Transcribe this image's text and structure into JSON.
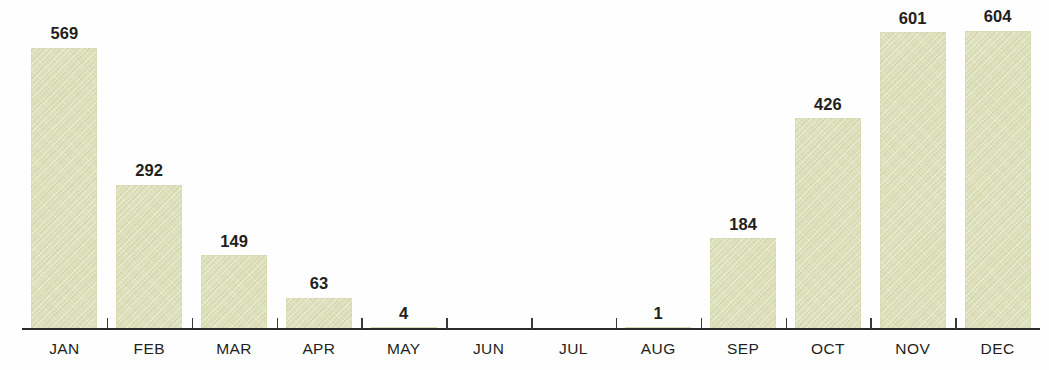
{
  "chart_data": {
    "type": "bar",
    "title": "",
    "subtitle": "",
    "xlabel": "",
    "ylabel": "",
    "categories": [
      "JAN",
      "FEB",
      "MAR",
      "APR",
      "MAY",
      "JUN",
      "JUL",
      "AUG",
      "SEP",
      "OCT",
      "NOV",
      "DEC"
    ],
    "values": [
      569,
      292,
      149,
      63,
      4,
      0,
      0,
      1,
      184,
      426,
      601,
      604
    ],
    "value_labels": [
      "569",
      "292",
      "149",
      "63",
      "4",
      "",
      "",
      "1",
      "184",
      "426",
      "601",
      "604"
    ],
    "ylim": [
      0,
      650
    ],
    "grid": false,
    "legend": null,
    "legend_position": "none",
    "axis": {
      "x_axis_visible": true,
      "y_axis_visible": false,
      "tick_marks": "between-categories"
    },
    "annotations": [
      "JUN and JUL have no visible bar and no value label",
      "AUG value label 1 shown with no visible bar",
      "MAY bar is a thin sliver at the baseline"
    ]
  },
  "style": {
    "bar_fill": "#dde0b8",
    "bar_texture": "diagonal-hatch",
    "text_color": "#231f20",
    "axis_color": "#2b2b29",
    "background": "#fefefe"
  }
}
